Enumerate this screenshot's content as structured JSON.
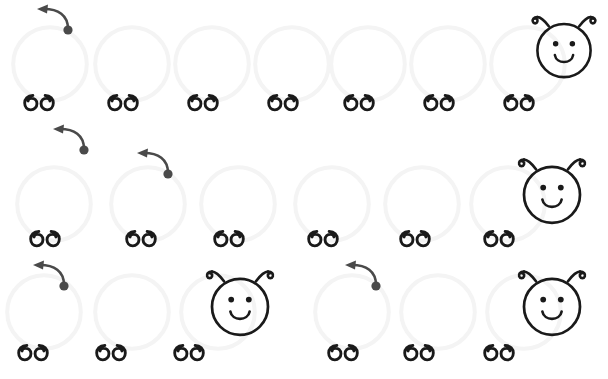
{
  "canvas": {
    "width": 608,
    "height": 379,
    "background_color": "#ffffff",
    "title": "Caterpillar counting activity"
  },
  "palette": {
    "ink": "#1a1a1a",
    "segment_outline": "#f4f4f4",
    "gesture": "#4a4a4a",
    "background": "#ffffff"
  },
  "legend": {
    "segment_icon_name": "caterpillar-body-segment",
    "feet_icon_name": "caterpillar-feet-pair",
    "head_icon_name": "caterpillar-head-smiley",
    "gesture_icon_name": "drag-gesture-arrow"
  },
  "rows": [
    {
      "id": "row-1",
      "label": "Caterpillar row 1",
      "segment_count": 7,
      "head_count": 1,
      "baseline_y": 112,
      "segments": [
        {
          "x": 10,
          "y": 24,
          "size": 80
        },
        {
          "x": 92,
          "y": 24,
          "size": 80
        },
        {
          "x": 172,
          "y": 24,
          "size": 80
        },
        {
          "x": 252,
          "y": 24,
          "size": 80
        },
        {
          "x": 328,
          "y": 24,
          "size": 80
        },
        {
          "x": 408,
          "y": 24,
          "size": 80
        },
        {
          "x": 488,
          "y": 24,
          "size": 80
        }
      ],
      "feet": [
        {
          "x": 24,
          "y": 93
        },
        {
          "x": 108,
          "y": 93
        },
        {
          "x": 188,
          "y": 93
        },
        {
          "x": 268,
          "y": 93
        },
        {
          "x": 344,
          "y": 93
        },
        {
          "x": 424,
          "y": 93
        },
        {
          "x": 504,
          "y": 93
        }
      ],
      "heads": [
        {
          "x": 526,
          "y": 8,
          "size": 76,
          "antennae": "both",
          "clipped": true
        }
      ],
      "gestures": [
        {
          "x": 34,
          "y": 2,
          "length": 36,
          "dot_x": 62,
          "dot_y": 20
        }
      ]
    },
    {
      "id": "row-2",
      "label": "Caterpillar row 2",
      "segment_count": 6,
      "head_count": 1,
      "baseline_y": 249,
      "segments": [
        {
          "x": 14,
          "y": 164,
          "size": 80
        },
        {
          "x": 108,
          "y": 164,
          "size": 80
        },
        {
          "x": 198,
          "y": 164,
          "size": 80
        },
        {
          "x": 292,
          "y": 164,
          "size": 80
        },
        {
          "x": 382,
          "y": 164,
          "size": 80
        },
        {
          "x": 468,
          "y": 164,
          "size": 80
        }
      ],
      "feet": [
        {
          "x": 30,
          "y": 229
        },
        {
          "x": 126,
          "y": 229
        },
        {
          "x": 214,
          "y": 229
        },
        {
          "x": 308,
          "y": 229
        },
        {
          "x": 400,
          "y": 229
        },
        {
          "x": 484,
          "y": 229
        }
      ],
      "heads": [
        {
          "x": 512,
          "y": 150,
          "size": 80,
          "antennae": "both",
          "clipped": false
        }
      ],
      "gestures": [
        {
          "x": 50,
          "y": 122,
          "length": 36,
          "dot_x": 78,
          "dot_y": 146
        },
        {
          "x": 134,
          "y": 146,
          "length": 34,
          "dot_x": 162,
          "dot_y": 173
        }
      ]
    },
    {
      "id": "row-3",
      "label": "Caterpillar row 3",
      "segment_count": 6,
      "head_count": 2,
      "baseline_y": 379,
      "segments": [
        {
          "x": 4,
          "y": 272,
          "size": 80
        },
        {
          "x": 92,
          "y": 272,
          "size": 80
        },
        {
          "x": 178,
          "y": 272,
          "size": 80
        },
        {
          "x": 312,
          "y": 272,
          "size": 80
        },
        {
          "x": 398,
          "y": 272,
          "size": 80
        },
        {
          "x": 484,
          "y": 272,
          "size": 80
        }
      ],
      "feet": [
        {
          "x": 18,
          "y": 343
        },
        {
          "x": 96,
          "y": 343
        },
        {
          "x": 174,
          "y": 343
        },
        {
          "x": 328,
          "y": 343
        },
        {
          "x": 404,
          "y": 343
        },
        {
          "x": 484,
          "y": 343
        }
      ],
      "heads": [
        {
          "x": 200,
          "y": 262,
          "size": 80,
          "antennae": "both",
          "clipped": false
        },
        {
          "x": 512,
          "y": 262,
          "size": 80,
          "antennae": "both",
          "clipped": false
        }
      ],
      "gestures": [
        {
          "x": 30,
          "y": 258,
          "length": 34,
          "dot_x": 60,
          "dot_y": 284
        },
        {
          "x": 342,
          "y": 258,
          "length": 34,
          "dot_x": 372,
          "dot_y": 284
        }
      ]
    }
  ],
  "counts": {
    "total_segments": 19,
    "total_heads": 4,
    "total_feet_pairs": 19,
    "total_gestures": 5
  }
}
